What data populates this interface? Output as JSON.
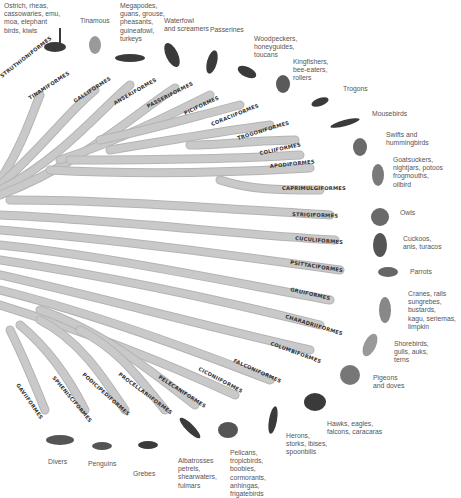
{
  "diagram": {
    "type": "phylogenetic-tree",
    "branch_color": "#c9c9c9",
    "label_color": "#555555"
  },
  "orders": [
    {
      "name": "STRUTHIONIFORMES"
    },
    {
      "name": "TINAMIFORMES"
    },
    {
      "name": "GALLIFORMES"
    },
    {
      "name": "ANSERIFORMES"
    },
    {
      "name": "PASSERIFORMES"
    },
    {
      "name": "PICIFORMES"
    },
    {
      "name": "CORACIIFORMES"
    },
    {
      "name": "TROGONIFORMES"
    },
    {
      "name": "COLIIFORMES"
    },
    {
      "name": "APODIFORMES"
    },
    {
      "name": "CAPRIMULGIFORMES"
    },
    {
      "name": "STRIGIFORMES"
    },
    {
      "name": "CUCULIFORMES"
    },
    {
      "name": "PSITTACIFORMES"
    },
    {
      "name": "GRUIFORMES"
    },
    {
      "name": "CHARADRIIFORMES"
    },
    {
      "name": "COLUMBIFORMES"
    },
    {
      "name": "FALCONIFORMES"
    },
    {
      "name": "CICONIIFORMES"
    },
    {
      "name": "PELECANIFORMES"
    },
    {
      "name": "PROCELLARIIFORMES"
    },
    {
      "name": "PODICIPEDIFORMES"
    },
    {
      "name": "SPHENISCIFORMES"
    },
    {
      "name": "GAVIIFORMES"
    }
  ],
  "groups": [
    {
      "label": "Ostrich, rheas,\ncassowaries, emu,\nmoa, elephant\nbirds, kiwis"
    },
    {
      "label": "Tinamous"
    },
    {
      "label": "Megapodes,\nguans, grouse,\npheasants,\nguineafowl,\nturkeys"
    },
    {
      "label": "Waterfowl\nand screamers"
    },
    {
      "label": "Passerines"
    },
    {
      "label": "Woodpeckers,\nhoneyguides,\ntoucans"
    },
    {
      "label": "Kingfishers,\nbee-eaters,\nrollers"
    },
    {
      "label": "Trogons"
    },
    {
      "label": "Mousebirds"
    },
    {
      "label": "Swifts and\nhummingbirds"
    },
    {
      "label": "Goatsuckers,\nnightjars, potoos\nfrogmouths,\noilbird"
    },
    {
      "label": "Owls"
    },
    {
      "label": "Cuckoos,\nanis, turacos"
    },
    {
      "label": "Parrots"
    },
    {
      "label": "Cranes, rails\nsungrebes,\nbustards,\nkagu, seriemas,\nlimpkin"
    },
    {
      "label": "Shorebirds,\ngulls, auks,\nterns"
    },
    {
      "label": "Pigeons\nand doves"
    },
    {
      "label": "Hawks, eagles,\nfalcons, caracaras"
    },
    {
      "label": "Herons,\nstorks, ibises,\nspoonbills"
    },
    {
      "label": "Pelicans,\ntropicbirds,\nboobies,\ncormorants,\nanhingas,\nfrigatebirds"
    },
    {
      "label": "Albatrosses\npetrels,\nshearwaters,\nfulmars"
    },
    {
      "label": "Grebes"
    },
    {
      "label": "Penguins"
    },
    {
      "label": "Divers"
    }
  ]
}
